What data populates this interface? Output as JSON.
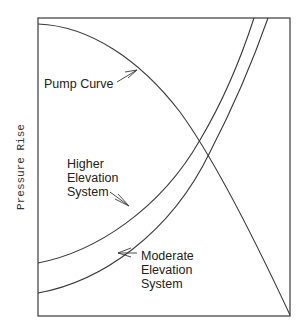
{
  "diagram": {
    "y_axis_label": "Pressure Rise",
    "x_axis_label": "",
    "colors": {
      "line": "#3a3a3a",
      "text": "#222222",
      "background": "#ffffff"
    },
    "curves": [
      {
        "id": "pump-curve",
        "label": "Pump Curve",
        "shape": "concave-down decreasing"
      },
      {
        "id": "higher-elevation-system",
        "label_lines": [
          "Higher",
          "Elevation",
          "System"
        ],
        "shape": "concave-up increasing, higher static head"
      },
      {
        "id": "moderate-elevation-system",
        "label_lines": [
          "Moderate",
          "Elevation",
          "System"
        ],
        "shape": "concave-up increasing, lower static head"
      }
    ]
  },
  "labels": {
    "pump": "Pump Curve",
    "higher": {
      "l1": "Higher",
      "l2": "Elevation",
      "l3": "System"
    },
    "moderate": {
      "l1": "Moderate",
      "l2": "Elevation",
      "l3": "System"
    }
  }
}
